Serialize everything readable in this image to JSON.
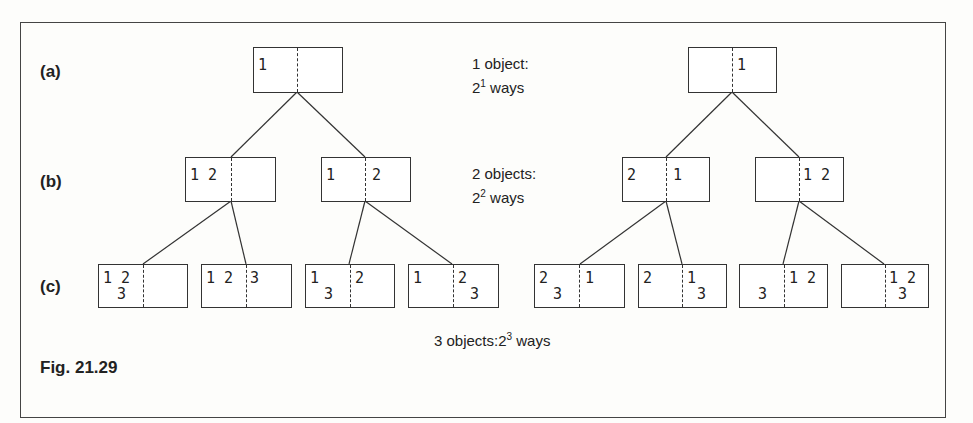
{
  "figure": {
    "caption": "Fig. 21.29",
    "row_labels": {
      "a": "(a)",
      "b": "(b)",
      "c": "(c)"
    },
    "notes": {
      "a": {
        "line1": "1 object:",
        "line2_base": "2",
        "line2_exp": "1",
        "line2_rest": " ways"
      },
      "b": {
        "line1": "2 objects:",
        "line2_base": "2",
        "line2_exp": "2",
        "line2_rest": " ways"
      },
      "c": {
        "prefix": "3 objects:2",
        "exp": "3",
        "rest": " ways"
      }
    },
    "trees": [
      {
        "root": {
          "left": "1",
          "right": ""
        },
        "children": [
          {
            "left": "1 2",
            "right": "",
            "children": [
              {
                "left_top": "1 2",
                "left_bottom": "3",
                "right_top": "",
                "right_bottom": ""
              },
              {
                "left_top": "1 2",
                "left_bottom": "",
                "right_top": "3",
                "right_bottom": ""
              }
            ]
          },
          {
            "left": "1",
            "right": "2",
            "children": [
              {
                "left_top": "1",
                "left_bottom": "3",
                "right_top": "2",
                "right_bottom": ""
              },
              {
                "left_top": "1",
                "left_bottom": "",
                "right_top": "2",
                "right_bottom": "3"
              }
            ]
          }
        ]
      },
      {
        "root": {
          "left": "",
          "right": "1"
        },
        "children": [
          {
            "left": "2",
            "right": "1",
            "children": [
              {
                "left_top": "2",
                "left_bottom": "3",
                "right_top": "1",
                "right_bottom": ""
              },
              {
                "left_top": "2",
                "left_bottom": "",
                "right_top": "1",
                "right_bottom": "3"
              }
            ]
          },
          {
            "left": "",
            "right": "1 2",
            "children": [
              {
                "left_top": "",
                "left_bottom": "3",
                "right_top": "1 2",
                "right_bottom": ""
              },
              {
                "left_top": "",
                "left_bottom": "",
                "right_top": "1 2",
                "right_bottom": "3"
              }
            ]
          }
        ]
      }
    ]
  }
}
